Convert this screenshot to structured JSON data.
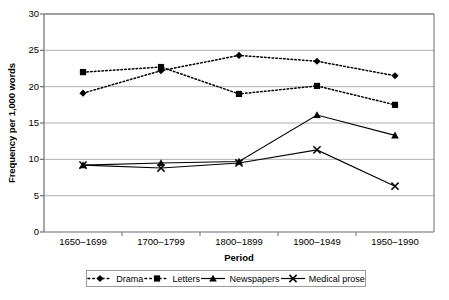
{
  "chart_data": {
    "type": "line",
    "title": "",
    "xlabel": "Period",
    "ylabel": "Frequency per 1,000 words",
    "categories": [
      "1650–1699",
      "1700–1799",
      "1800–1899",
      "1900–1949",
      "1950–1990"
    ],
    "ylim": [
      0,
      30
    ],
    "yticks": [
      "0",
      "5",
      "10",
      "15",
      "20",
      "25",
      "30"
    ],
    "ytick_values": [
      0,
      5,
      10,
      15,
      20,
      25,
      30
    ],
    "grid": "horizontal",
    "legend_position": "bottom",
    "series": [
      {
        "name": "Drama",
        "values": [
          19.1,
          22.2,
          24.3,
          23.5,
          21.5
        ],
        "marker": "diamond",
        "line_style": "dotted",
        "color": "#000000"
      },
      {
        "name": "Letters",
        "values": [
          22.0,
          22.7,
          19.0,
          20.1,
          17.5
        ],
        "marker": "square",
        "line_style": "dotted",
        "color": "#000000"
      },
      {
        "name": "Newspapers",
        "values": [
          9.2,
          9.5,
          9.7,
          16.1,
          13.3
        ],
        "marker": "triangle",
        "line_style": "solid",
        "color": "#000000"
      },
      {
        "name": "Medical prose",
        "values": [
          9.2,
          8.8,
          9.5,
          11.3,
          6.3
        ],
        "marker": "cross",
        "line_style": "solid",
        "color": "#000000"
      }
    ]
  },
  "plot": {
    "left": 44,
    "top": 14,
    "right": 434,
    "bottom": 232,
    "gridline_color": "#b0b0b0",
    "frame_color": "#6e6e6e",
    "background": "#ffffff"
  }
}
